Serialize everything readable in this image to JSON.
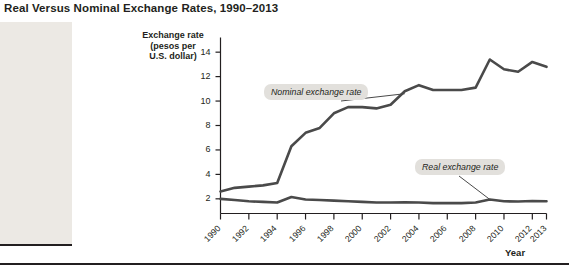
{
  "figure": {
    "title": "Real Versus Nominal Exchange Rates, 1990–2013",
    "caption": "13, the\nexican\natically. But\nigher infla-\nStates, the\nich accounts\nf Mexican\nded up\ned."
  },
  "chart_data": {
    "type": "line",
    "title": "Real Versus Nominal Exchange Rates, 1990–2013",
    "xlabel": "Year",
    "ylabel": "Exchange rate (pesos per U.S. dollar)",
    "ylabel_lines": [
      "Exchange rate",
      "(pesos per",
      "U.S. dollar)"
    ],
    "xlim": [
      1990,
      2013
    ],
    "ylim": [
      0.8,
      15.2
    ],
    "yticks": [
      2,
      4,
      6,
      8,
      10,
      12,
      14
    ],
    "ytick_labels": [
      "2",
      "4",
      "6",
      "8",
      "10",
      "12",
      "14"
    ],
    "xticks": [
      1990,
      1992,
      1994,
      1996,
      1998,
      2000,
      2002,
      2004,
      2006,
      2008,
      2010,
      2012,
      2013
    ],
    "xtick_labels": [
      "1990",
      "1992",
      "1994",
      "1996",
      "1998",
      "2000",
      "2002",
      "2004",
      "2006",
      "2008",
      "2010",
      "2012",
      "2013"
    ],
    "grid": false,
    "legend_position": "inline-callouts",
    "x": [
      1990,
      1991,
      1992,
      1993,
      1994,
      1995,
      1996,
      1997,
      1998,
      1999,
      2000,
      2001,
      2002,
      2003,
      2004,
      2005,
      2006,
      2007,
      2008,
      2009,
      2010,
      2011,
      2012,
      2013
    ],
    "series": [
      {
        "name": "Nominal exchange rate",
        "color": "#4a4a4a",
        "values": [
          2.6,
          2.9,
          3.0,
          3.1,
          3.3,
          6.3,
          7.4,
          7.8,
          9.0,
          9.5,
          9.5,
          9.4,
          9.7,
          10.8,
          11.3,
          10.9,
          10.9,
          10.9,
          11.1,
          13.4,
          12.6,
          12.4,
          13.2,
          12.8
        ]
      },
      {
        "name": "Real exchange rate",
        "color": "#4a4a4a",
        "values": [
          2.0,
          1.9,
          1.8,
          1.75,
          1.7,
          2.15,
          1.95,
          1.9,
          1.85,
          1.8,
          1.75,
          1.7,
          1.7,
          1.72,
          1.7,
          1.65,
          1.65,
          1.65,
          1.7,
          1.95,
          1.8,
          1.78,
          1.82,
          1.8
        ]
      }
    ],
    "annotations": [
      {
        "text": "Nominal exchange rate",
        "target_x": 2003,
        "target_y": 10.6
      },
      {
        "text": "Real exchange rate",
        "target_x": 2009,
        "target_y": 1.95
      }
    ]
  }
}
